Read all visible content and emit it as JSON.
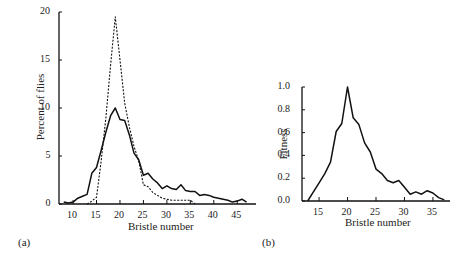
{
  "chart_data": [
    {
      "panel": "(a)",
      "type": "line",
      "xlabel": "Bristle number",
      "ylabel": "Percent of flies",
      "xticks": [
        10,
        15,
        20,
        25,
        30,
        35,
        40,
        45
      ],
      "yticks": [
        0,
        5,
        10,
        15,
        20
      ],
      "xlim": [
        7,
        49
      ],
      "ylim": [
        0,
        20
      ],
      "grid": false,
      "series": [
        {
          "name": "solid",
          "style": "solid",
          "x": [
            8,
            9,
            10,
            11,
            12,
            13,
            14,
            15,
            16,
            17,
            18,
            19,
            20,
            21,
            22,
            23,
            24,
            25,
            26,
            27,
            28,
            29,
            30,
            31,
            32,
            33,
            34,
            35,
            36,
            37,
            38,
            39,
            40,
            41,
            42,
            43,
            44,
            45,
            46,
            47
          ],
          "y": [
            0.2,
            0.1,
            0.2,
            0.6,
            0.8,
            1.0,
            3.2,
            3.8,
            5.6,
            7.5,
            9.2,
            10.0,
            8.8,
            8.7,
            7.2,
            5.3,
            4.6,
            3.0,
            3.2,
            2.6,
            2.2,
            1.6,
            1.9,
            1.6,
            1.5,
            2.0,
            1.4,
            1.3,
            1.3,
            0.9,
            1.0,
            0.9,
            0.7,
            0.6,
            0.5,
            0.4,
            0.2,
            0.3,
            0.5,
            0.2
          ]
        },
        {
          "name": "dashed",
          "style": "dashed",
          "x": [
            13,
            14,
            15,
            16,
            17,
            18,
            19,
            20,
            21,
            22,
            23,
            24,
            25,
            26,
            27,
            28,
            29,
            30,
            31,
            32,
            33,
            34,
            35,
            36
          ],
          "y": [
            0,
            0.3,
            0.7,
            4.5,
            9.0,
            14.5,
            19.5,
            15.0,
            10.5,
            8.0,
            6.0,
            4.5,
            2.0,
            1.8,
            1.2,
            0.9,
            0.6,
            0.5,
            0.4,
            0.4,
            0.4,
            0.4,
            0.4,
            0
          ]
        }
      ]
    },
    {
      "panel": "(b)",
      "type": "line",
      "xlabel": "Bristle number",
      "ylabel": "Fitness",
      "xticks": [
        15,
        20,
        25,
        30,
        35
      ],
      "yticks": [
        0.0,
        0.2,
        0.4,
        0.6,
        0.8,
        1.0
      ],
      "xlim": [
        12,
        38
      ],
      "ylim": [
        0,
        1.0
      ],
      "grid": false,
      "series": [
        {
          "name": "fitness",
          "style": "solid",
          "x": [
            13,
            14,
            15,
            16,
            17,
            18,
            19,
            20,
            21,
            22,
            23,
            24,
            25,
            26,
            27,
            28,
            29,
            30,
            31,
            32,
            33,
            34,
            35,
            36,
            37
          ],
          "y": [
            0.0,
            0.08,
            0.16,
            0.24,
            0.34,
            0.61,
            0.68,
            1.0,
            0.73,
            0.67,
            0.51,
            0.43,
            0.28,
            0.24,
            0.18,
            0.16,
            0.18,
            0.12,
            0.06,
            0.08,
            0.06,
            0.09,
            0.07,
            0.03,
            0.01
          ]
        }
      ]
    }
  ],
  "panels": {
    "a": {
      "label": "(a)",
      "xlabel": "Bristle number",
      "ylabel": "Percent of flies"
    },
    "b": {
      "label": "(b)",
      "xlabel": "Bristle number",
      "ylabel": "Fitness"
    }
  }
}
